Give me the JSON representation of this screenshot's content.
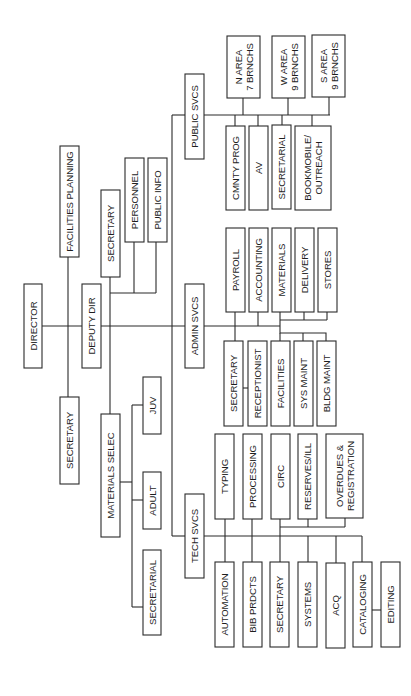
{
  "orientation": "rotated-90-ccw",
  "colors": {
    "line": "#2a2a2a",
    "text": "#1e1e1e",
    "background": "#ffffff"
  },
  "nodes": [
    {
      "id": "director",
      "label": [
        "DIRECTOR"
      ],
      "x": 24,
      "y": 284,
      "w": 18,
      "h": 84
    },
    {
      "id": "facilities-planning",
      "label": [
        "FACILITIES  PLANNING"
      ],
      "x": 60,
      "y": 146,
      "w": 19,
      "h": 111
    },
    {
      "id": "secretary-director",
      "label": [
        "SECRETARY"
      ],
      "x": 60,
      "y": 397,
      "w": 19,
      "h": 87
    },
    {
      "id": "deputy-dir",
      "label": [
        "DEPUTY DIR"
      ],
      "x": 82,
      "y": 284,
      "w": 19,
      "h": 84
    },
    {
      "id": "secretary-deputy",
      "label": [
        "SECRETARY"
      ],
      "x": 101,
      "y": 190,
      "w": 19,
      "h": 87
    },
    {
      "id": "personnel",
      "label": [
        "PERSONNEL"
      ],
      "x": 125,
      "y": 158,
      "w": 19,
      "h": 84
    },
    {
      "id": "public-info",
      "label": [
        "PUBLIC INFO"
      ],
      "x": 148,
      "y": 158,
      "w": 19,
      "h": 84
    },
    {
      "id": "materials-selec",
      "label": [
        "MATERIALS SELEC"
      ],
      "x": 101,
      "y": 414,
      "w": 19,
      "h": 123
    },
    {
      "id": "juv",
      "label": [
        "JUV"
      ],
      "x": 143,
      "y": 377,
      "w": 18,
      "h": 57
    },
    {
      "id": "adult",
      "label": [
        "ADULT"
      ],
      "x": 143,
      "y": 472,
      "w": 18,
      "h": 57
    },
    {
      "id": "secretarial-materials",
      "label": [
        "SECRETARIAL"
      ],
      "x": 143,
      "y": 550,
      "w": 18,
      "h": 85
    },
    {
      "id": "public-svcs",
      "label": [
        "PUBLIC SVCS"
      ],
      "x": 185,
      "y": 74,
      "w": 19,
      "h": 85
    },
    {
      "id": "admin-svcs",
      "label": [
        "ADMIN SVCS"
      ],
      "x": 185,
      "y": 284,
      "w": 19,
      "h": 84
    },
    {
      "id": "tech-svcs",
      "label": [
        "TECH SVCS"
      ],
      "x": 185,
      "y": 494,
      "w": 19,
      "h": 84
    },
    {
      "id": "n-area",
      "label": [
        "N AREA",
        "7 BRNCHS"
      ],
      "x": 227,
      "y": 36,
      "w": 33,
      "h": 62
    },
    {
      "id": "w-area",
      "label": [
        "W AREA",
        "9 BRNCHS"
      ],
      "x": 272,
      "y": 36,
      "w": 33,
      "h": 62
    },
    {
      "id": "s-area",
      "label": [
        "S AREA",
        "9 BRNCHS"
      ],
      "x": 312,
      "y": 35,
      "w": 33,
      "h": 62
    },
    {
      "id": "cmnty-prog",
      "label": [
        "CMNTY PROG"
      ],
      "x": 226,
      "y": 126,
      "w": 19,
      "h": 84
    },
    {
      "id": "av",
      "label": [
        "AV"
      ],
      "x": 249,
      "y": 126,
      "w": 19,
      "h": 84
    },
    {
      "id": "secretarial-public",
      "label": [
        "SECRETARIAL"
      ],
      "x": 272,
      "y": 125,
      "w": 19,
      "h": 84
    },
    {
      "id": "bookmobile-outreach",
      "label": [
        "BOOKMOBILE/",
        "OUTREACH"
      ],
      "x": 295,
      "y": 126,
      "w": 36,
      "h": 84
    },
    {
      "id": "payroll",
      "label": [
        "PAYROLL"
      ],
      "x": 226,
      "y": 228,
      "w": 19,
      "h": 84
    },
    {
      "id": "accounting",
      "label": [
        "ACCOUNTING"
      ],
      "x": 249,
      "y": 228,
      "w": 19,
      "h": 84
    },
    {
      "id": "materials-admin",
      "label": [
        "MATERIALS"
      ],
      "x": 272,
      "y": 228,
      "w": 19,
      "h": 84
    },
    {
      "id": "delivery",
      "label": [
        "DELIVERY"
      ],
      "x": 295,
      "y": 228,
      "w": 19,
      "h": 84
    },
    {
      "id": "stores",
      "label": [
        "STORES"
      ],
      "x": 318,
      "y": 228,
      "w": 19,
      "h": 84
    },
    {
      "id": "secretary-admin",
      "label": [
        "SECRETARY"
      ],
      "x": 224,
      "y": 341,
      "w": 19,
      "h": 85
    },
    {
      "id": "receptionist",
      "label": [
        "RECEPTIONIST"
      ],
      "x": 248,
      "y": 341,
      "w": 19,
      "h": 85
    },
    {
      "id": "facilities",
      "label": [
        "FACILITIES"
      ],
      "x": 271,
      "y": 341,
      "w": 19,
      "h": 85
    },
    {
      "id": "sys-maint",
      "label": [
        "SYS MAINT"
      ],
      "x": 294,
      "y": 341,
      "w": 19,
      "h": 85
    },
    {
      "id": "bldg-maint",
      "label": [
        "BLDG MAINT"
      ],
      "x": 317,
      "y": 341,
      "w": 19,
      "h": 85
    },
    {
      "id": "typing",
      "label": [
        "TYPING"
      ],
      "x": 215,
      "y": 434,
      "w": 19,
      "h": 85
    },
    {
      "id": "processing",
      "label": [
        "PROCESSING"
      ],
      "x": 243,
      "y": 434,
      "w": 19,
      "h": 85
    },
    {
      "id": "circ",
      "label": [
        "CIRC"
      ],
      "x": 271,
      "y": 434,
      "w": 19,
      "h": 85
    },
    {
      "id": "reserves-ill",
      "label": [
        "RESERVES/ILL"
      ],
      "x": 298,
      "y": 434,
      "w": 19,
      "h": 85
    },
    {
      "id": "overdues-registration",
      "label": [
        "OVERDUES &",
        "REGISTRATION"
      ],
      "x": 326,
      "y": 434,
      "w": 37,
      "h": 84
    },
    {
      "id": "automation",
      "label": [
        "AUTOMATION"
      ],
      "x": 215,
      "y": 562,
      "w": 19,
      "h": 85
    },
    {
      "id": "bib-prdcts",
      "label": [
        "BIB PRDCTS"
      ],
      "x": 243,
      "y": 562,
      "w": 19,
      "h": 85
    },
    {
      "id": "secretary-tech",
      "label": [
        "SECRETARY"
      ],
      "x": 270,
      "y": 562,
      "w": 19,
      "h": 85
    },
    {
      "id": "systems",
      "label": [
        "SYSTEMS"
      ],
      "x": 298,
      "y": 562,
      "w": 19,
      "h": 85
    },
    {
      "id": "acq",
      "label": [
        "ACQ"
      ],
      "x": 326,
      "y": 563,
      "w": 19,
      "h": 85
    },
    {
      "id": "cataloging",
      "label": [
        "CATALOGING"
      ],
      "x": 353,
      "y": 562,
      "w": 19,
      "h": 85
    },
    {
      "id": "editing",
      "label": [
        "EDITING"
      ],
      "x": 381,
      "y": 562,
      "w": 19,
      "h": 85
    }
  ],
  "edges": [
    "M42,326 L82,326",
    "M68,257 L68,397",
    "M101,326 L185,326",
    "M110,277 L110,414",
    "M110,293 L156,293",
    "M134,242 L134,293",
    "M156,242 L156,293",
    "M172,115 L172,536",
    "M172,115 L185,115",
    "M172,536 L185,536",
    "M120,482 L132,482",
    "M132,405 L132,607",
    "M132,405 L143,405",
    "M132,500 L143,500",
    "M132,607 L143,607",
    "M204,115 L330,115",
    "M243,98 L243,115",
    "M288,98 L288,115",
    "M329,97 L329,115",
    "M235,115 L235,126",
    "M258,115 L258,126",
    "M282,115 L282,125",
    "M312,115 L312,126",
    "M204,326 L280,326",
    "M235,312 L235,341",
    "M258,312 L258,326",
    "M280,312 L280,326",
    "M280,320 L327,320",
    "M304,312 L304,320",
    "M327,312 L327,320",
    "M280,326 L280,333 L326,333 L326,341",
    "M303,333 L303,341",
    "M280,333 L280,341",
    "M243,388 L248,388",
    "M204,536 L362,536",
    "M225,519 L225,562",
    "M252,519 L252,562",
    "M280,519 L280,562",
    "M280,527 L345,527",
    "M308,519 L308,527",
    "M345,518 L345,527",
    "M308,536 L308,562",
    "M336,536 L336,563",
    "M362,536 L362,562",
    "M372,610 L381,610"
  ]
}
